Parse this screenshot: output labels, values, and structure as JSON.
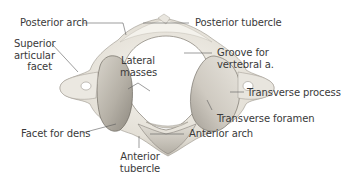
{
  "figure": {
    "colors": {
      "background": "#ffffff",
      "bone_light": "#f2f0ea",
      "bone_mid": "#d9d5cc",
      "bone_shadow": "#a9a49b",
      "leader_line": "#5a5a5a",
      "label_text": "#3a3a3a"
    }
  },
  "labels": {
    "posterior_arch": "Posterior arch",
    "posterior_tubercle": "Posterior  tubercle",
    "superior_articular_facet": [
      "Superior",
      "articular",
      "facet"
    ],
    "groove_for_vertebral_a": [
      "Groove for",
      "vertebral a."
    ],
    "lateral_masses": [
      "Lateral",
      "masses"
    ],
    "transverse_process": "Transverse process",
    "transverse_foramen": "Transverse foramen",
    "facet_for_dens": "Facet for dens",
    "anterior_arch": "Anterior arch",
    "anterior_tubercle": [
      "Anterior",
      "tubercle"
    ]
  }
}
